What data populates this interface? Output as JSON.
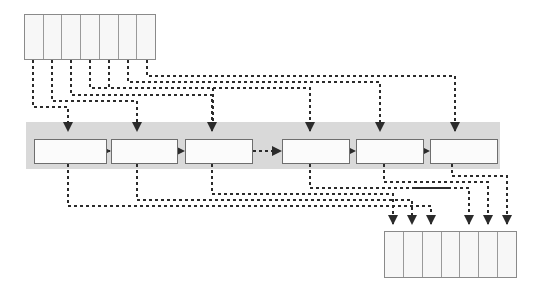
{
  "diagram": {
    "title": "",
    "type": "dataflow-permutation-network",
    "colors": {
      "band": "#d9d9d9",
      "box_fill": "#fbfbfb",
      "box_stroke": "#6e6e6e",
      "cell_fill": "#f7f7f7",
      "cell_stroke": "#8a8a8a",
      "wire": "#2b2b2b"
    },
    "input_register": {
      "name": "input-register",
      "x": 24,
      "y": 14,
      "width": 132,
      "height": 46,
      "cell_count": 7,
      "cells": [
        "",
        "",
        "",
        "",
        "",
        "",
        ""
      ]
    },
    "pipeline_band": {
      "name": "pipeline-band",
      "x": 26,
      "y": 122,
      "width": 474,
      "height": 47
    },
    "pipeline_stages": [
      {
        "label": "",
        "x": 34,
        "y": 139,
        "width": 73,
        "height": 25
      },
      {
        "label": "",
        "x": 111,
        "y": 139,
        "width": 67,
        "height": 25
      },
      {
        "label": "",
        "x": 185,
        "y": 139,
        "width": 68,
        "height": 25
      },
      {
        "label": "",
        "x": 282,
        "y": 139,
        "width": 68,
        "height": 25
      },
      {
        "label": "",
        "x": 356,
        "y": 139,
        "width": 68,
        "height": 25
      },
      {
        "label": "",
        "x": 430,
        "y": 139,
        "width": 68,
        "height": 25
      }
    ],
    "output_register": {
      "name": "output-register",
      "x": 384,
      "y": 231,
      "width": 133,
      "height": 47,
      "cell_count": 7,
      "cells": [
        "",
        "",
        "",
        "",
        "",
        "",
        ""
      ]
    },
    "top_taps_x": [
      33,
      52,
      71,
      90,
      109,
      128,
      147
    ],
    "stage_arrow_x": [
      68,
      137,
      212,
      310,
      384,
      452
    ],
    "output_arrow_x": [
      393,
      412,
      431,
      469,
      488,
      507
    ],
    "ellipsis_between_stages": "3-4",
    "legend": []
  }
}
